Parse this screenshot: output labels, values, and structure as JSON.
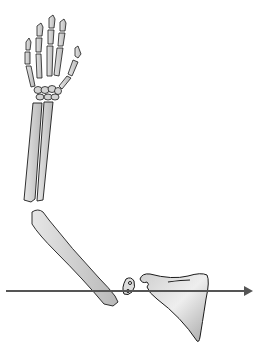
{
  "figure": {
    "colors": {
      "background": "#ffffff",
      "outline": "#1a1a1a",
      "bone_fill": "#d8d8d8",
      "bone_shade": "#b0b0b0",
      "arrow": "#555555"
    },
    "parts": [
      "hand",
      "carpals",
      "radius",
      "ulna",
      "humerus",
      "clavicle",
      "scapula",
      "axis-arrow"
    ]
  }
}
